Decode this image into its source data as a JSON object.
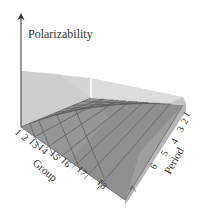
{
  "diagram": {
    "title": "Polarizability",
    "z_axis_label": "Polarizability",
    "x_axis_label": "Group",
    "y_axis_label": "Period",
    "group_ticks": [
      "1",
      "2",
      "13",
      "14",
      "15",
      "16",
      "17",
      "18"
    ],
    "period_ticks": [
      "1",
      "2",
      "3",
      "4",
      "5",
      "6",
      "7"
    ],
    "trend": "Polarizability increases toward lower-left (Group 1, Period 7) and decreases toward upper-right (Group 18, Period 1)",
    "colors": {
      "surface": "#8f8f8f",
      "grid_lines": "#5a5a5a",
      "back_wall": "#d9d9d9",
      "left_wall": "#cfcfcf",
      "right_side": "#a8a8a8",
      "axis": "#333333",
      "text": "#333333"
    }
  }
}
